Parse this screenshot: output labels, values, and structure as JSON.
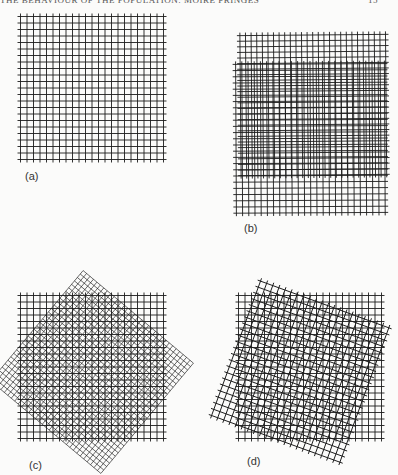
{
  "page": {
    "running_head": "THE BEHAVIOUR OF THE POPULATION: MOIRE FRINGES",
    "page_number": "15"
  },
  "figure": {
    "ink_color": "#1c1c1c",
    "panels": [
      {
        "id": "a",
        "label": "(a)",
        "description": "single square grid",
        "overlay": "none"
      },
      {
        "id": "b",
        "label": "(b)",
        "description": "two square grids of slightly different spacing, parallel, offset",
        "overlay": "different spacing",
        "rotation_deg": 0
      },
      {
        "id": "c",
        "label": "(c)",
        "description": "square grid overlaid by a finer grid rotated about 40 degrees",
        "overlay": "rotated finer grid",
        "rotation_deg": 40
      },
      {
        "id": "d",
        "label": "(d)",
        "description": "square grid overlaid by an equal grid rotated about 20 degrees",
        "overlay": "rotated equal grid",
        "rotation_deg": 20
      }
    ]
  }
}
